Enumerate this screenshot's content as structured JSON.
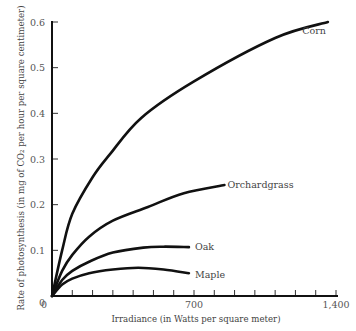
{
  "chart_data": {
    "type": "line",
    "title": "",
    "xlabel": "Irradiance (in Watts per square meter)",
    "ylabel": "Rate of photosynthesis (in mg of CO₂ per hour per square centimeter)",
    "xlim": [
      0,
      1400
    ],
    "ylim": [
      0,
      0.6
    ],
    "x_ticks": [
      0,
      100,
      200,
      300,
      400,
      500,
      600,
      700,
      800,
      900,
      1000,
      1100,
      1200,
      1300,
      1400
    ],
    "x_tick_labels": [
      {
        "value": 0,
        "label": "0"
      },
      {
        "value": 700,
        "label": "700"
      },
      {
        "value": 1400,
        "label": "1,400"
      }
    ],
    "y_ticks": [
      0.1,
      0.2,
      0.3,
      0.4,
      0.5,
      0.6
    ],
    "y_tick_labels": [
      {
        "value": 0,
        "label": "0"
      },
      {
        "value": 0.1,
        "label": "0.1"
      },
      {
        "value": 0.2,
        "label": "0.2"
      },
      {
        "value": 0.3,
        "label": "0.3"
      },
      {
        "value": 0.4,
        "label": "0.4"
      },
      {
        "value": 0.5,
        "label": "0.5"
      },
      {
        "value": 0.6,
        "label": "0.6"
      }
    ],
    "grid": false,
    "legend": "inline labels at curve ends",
    "series": [
      {
        "name": "Corn",
        "x": [
          0,
          50,
          100,
          200,
          285,
          440,
          700,
          1100,
          1360
        ],
        "y": [
          0,
          0.1,
          0.18,
          0.26,
          0.31,
          0.39,
          0.47,
          0.565,
          0.6
        ]
      },
      {
        "name": "Orchardgrass",
        "x": [
          0,
          50,
          100,
          183,
          300,
          473,
          650,
          850
        ],
        "y": [
          0,
          0.055,
          0.09,
          0.13,
          0.165,
          0.195,
          0.225,
          0.243
        ]
      },
      {
        "name": "Oak",
        "x": [
          0,
          50,
          100,
          183,
          300,
          450,
          550,
          675
        ],
        "y": [
          0,
          0.035,
          0.055,
          0.075,
          0.095,
          0.106,
          0.108,
          0.107
        ]
      },
      {
        "name": "Maple",
        "x": [
          0,
          50,
          100,
          183,
          300,
          425,
          550,
          675
        ],
        "y": [
          0,
          0.025,
          0.038,
          0.05,
          0.058,
          0.062,
          0.058,
          0.05
        ]
      }
    ]
  }
}
